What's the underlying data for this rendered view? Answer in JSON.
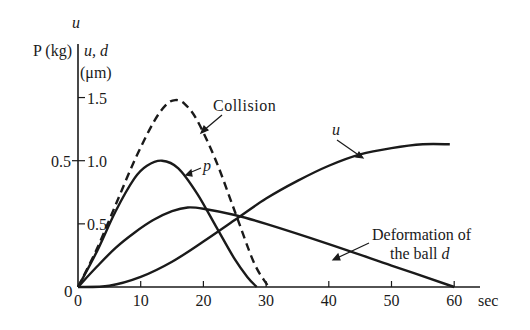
{
  "chart_data": {
    "type": "line",
    "title": "",
    "xlabel": "sec",
    "ylabel_left": "P (kg)",
    "ylabel_right_top": "u",
    "ylabel_right": "u, d",
    "ylabel_right_unit": "(μm)",
    "xlim": [
      0,
      60
    ],
    "ylim_right": [
      0,
      1.5
    ],
    "ylim_left": [
      0,
      0.75
    ],
    "x_ticks": [
      0,
      10,
      20,
      30,
      40,
      50,
      60
    ],
    "x_tick_labels": [
      "0",
      "10",
      "20",
      "30",
      "40",
      "50",
      "60"
    ],
    "y_right_ticks": [
      0.5,
      1.0,
      1.5
    ],
    "y_right_tick_labels": [
      "0.5",
      "1.0",
      "1.5"
    ],
    "y_left_ticks": [
      0.5
    ],
    "y_left_tick_labels": [
      "0.5"
    ],
    "origin_label": "0",
    "grid": false,
    "series": [
      {
        "name": "Collision",
        "style": "dashed",
        "x": [
          0,
          3,
          6,
          9,
          12,
          14,
          15.5,
          17,
          19,
          22,
          25,
          28,
          30,
          30.5
        ],
        "values": [
          0,
          0.3,
          0.65,
          1.0,
          1.3,
          1.44,
          1.48,
          1.45,
          1.32,
          1.0,
          0.6,
          0.2,
          0.03,
          0
        ]
      },
      {
        "name": "p",
        "style": "solid",
        "axis": "left",
        "x": [
          0,
          3,
          6,
          9,
          11,
          13.4,
          16,
          19,
          22,
          25,
          27,
          28.5
        ],
        "values": [
          0,
          0.14,
          0.3,
          0.43,
          0.48,
          0.5,
          0.47,
          0.37,
          0.24,
          0.11,
          0.04,
          0
        ]
      },
      {
        "name": "u",
        "style": "solid",
        "x": [
          0,
          5,
          10,
          15,
          20,
          25,
          30,
          35,
          40,
          45,
          50,
          55,
          59.3
        ],
        "values": [
          0,
          0.01,
          0.08,
          0.2,
          0.36,
          0.53,
          0.7,
          0.84,
          0.96,
          1.05,
          1.1,
          1.13,
          1.13
        ]
      },
      {
        "name": "Deformation of the ball d",
        "style": "solid",
        "x": [
          0,
          3,
          6,
          9,
          12,
          15,
          17.5,
          20,
          25,
          30,
          40,
          50,
          60
        ],
        "values": [
          0,
          0.16,
          0.31,
          0.43,
          0.53,
          0.6,
          0.63,
          0.62,
          0.57,
          0.5,
          0.34,
          0.17,
          0
        ]
      }
    ],
    "annotations": [
      {
        "text": "Collision",
        "target": "Collision"
      },
      {
        "text": "p",
        "target": "p"
      },
      {
        "text": "u",
        "target": "u"
      },
      {
        "text": "Deformation of",
        "target": "Deformation of the ball d"
      },
      {
        "text": "the ball d",
        "target": "Deformation of the ball d"
      }
    ]
  }
}
